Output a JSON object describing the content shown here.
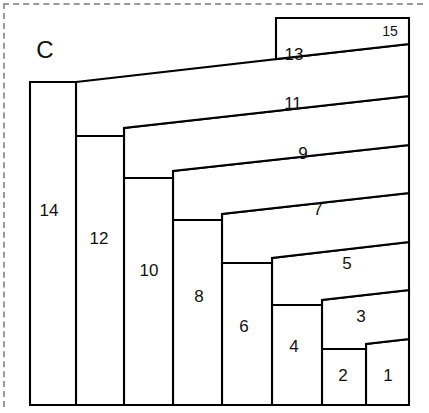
{
  "figure": {
    "label": "C",
    "label_x": 45,
    "label_y": 52,
    "frame": {
      "style": "dashed",
      "color": "#9a9a9a"
    },
    "outline_color": "#000000",
    "fill_color": "#ffffff"
  },
  "chart_data": {
    "type": "diagram",
    "title": "C",
    "piece_count": 15,
    "pieces": [
      {
        "number": "1",
        "label_x": 388,
        "label_y": 377,
        "points": "366,344 409,339 409,405 366,405",
        "orientation": "horizontal-end"
      },
      {
        "number": "2",
        "label_x": 343,
        "label_y": 377,
        "points": "322,349 366,344 366,405 322,405",
        "orientation": "vertical"
      },
      {
        "number": "3",
        "label_x": 361,
        "label_y": 318,
        "points": "322,300 409,290 409,339 366,344 366,349 322,349",
        "orientation": "horizontal"
      },
      {
        "number": "4",
        "label_x": 294,
        "label_y": 348,
        "points": "272,305 322,300 322,405 272,405",
        "orientation": "vertical"
      },
      {
        "number": "5",
        "label_x": 347,
        "label_y": 265,
        "points": "272,258 409,242 409,290 322,300 322,305 272,305",
        "orientation": "horizontal"
      },
      {
        "number": "6",
        "label_x": 244,
        "label_y": 328,
        "points": "222,263 272,258 272,405 222,405",
        "orientation": "vertical"
      },
      {
        "number": "7",
        "label_x": 318,
        "label_y": 211,
        "points": "222,214 409,193 409,242 272,258 272,263 222,263",
        "orientation": "horizontal"
      },
      {
        "number": "8",
        "label_x": 199,
        "label_y": 298,
        "points": "173,220 222,214 222,405 173,405",
        "orientation": "vertical"
      },
      {
        "number": "9",
        "label_x": 303,
        "label_y": 155,
        "points": "173,171 409,145 409,193 222,214 222,220 173,220",
        "orientation": "horizontal"
      },
      {
        "number": "10",
        "label_x": 149,
        "label_y": 272,
        "points": "124,178 173,171 173,405 124,405",
        "orientation": "vertical"
      },
      {
        "number": "11",
        "label_x": 293,
        "label_y": 105,
        "points": "124,128 409,96 409,145 173,171 173,178 124,178",
        "orientation": "horizontal"
      },
      {
        "number": "12",
        "label_x": 99,
        "label_y": 240,
        "points": "76,136 124,128 124,405 76,405",
        "orientation": "vertical"
      },
      {
        "number": "13",
        "label_x": 294,
        "label_y": 56,
        "points": "76,82 409,44 409,96 124,128 124,136 76,136",
        "orientation": "horizontal"
      },
      {
        "number": "14",
        "label_x": 49,
        "label_y": 212,
        "points": "30,82 76,82 76,405 30,405",
        "orientation": "vertical"
      },
      {
        "number": "15",
        "label_x": 390,
        "label_y": 32,
        "points": "276,18 409,18 409,44 276,59",
        "orientation": "horizontal-top"
      }
    ],
    "outer_boundary": "30,82 30,405 409,405 409,18 276,18 76,82",
    "bounds": {
      "left": 30,
      "top": 18,
      "right": 409,
      "bottom": 405
    }
  }
}
